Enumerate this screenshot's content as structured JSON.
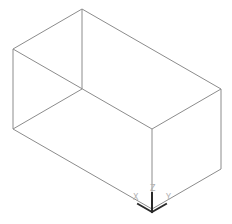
{
  "viewport": {
    "background": "#ffffff",
    "edge_color": "#8c8c8c",
    "axis_color": "#2a2a2a",
    "axis_label_color": "#b0b0b0"
  },
  "model": {
    "type": "wireframe-box",
    "vertices": {
      "top_back": [
        82,
        9
      ],
      "top_left": [
        13,
        49
      ],
      "top_right": [
        221,
        89
      ],
      "top_front": [
        152,
        129
      ],
      "bottom_back": [
        82,
        89
      ],
      "bottom_left": [
        13,
        129
      ],
      "bottom_right": [
        221,
        169
      ],
      "bottom_front": [
        152,
        209
      ]
    }
  },
  "axis_indicator": {
    "origin": [
      152,
      212
    ],
    "labels": {
      "x": "X",
      "y": "Y",
      "z": "Z"
    }
  }
}
